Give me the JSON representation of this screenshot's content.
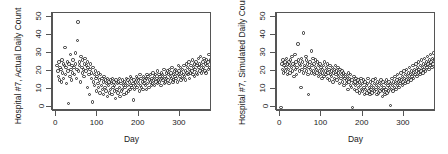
{
  "figure": {
    "background": "#ffffff",
    "axis_color": "#555555",
    "point_color": "#2b2b2b",
    "panel_count": 2
  },
  "chart_data": [
    {
      "type": "scatter",
      "title": "",
      "xlabel": "Day",
      "ylabel": "Hospital #7, Actual Daily Count",
      "xlim": [
        -8,
        378
      ],
      "ylim": [
        -2,
        52
      ],
      "xticks": [
        0,
        100,
        200,
        300
      ],
      "yticks": [
        0,
        10,
        20,
        30,
        40,
        50
      ],
      "grid": false,
      "legend": "none",
      "marker": "open-circle",
      "x": [
        2,
        4,
        5,
        7,
        8,
        9,
        11,
        12,
        14,
        15,
        17,
        18,
        20,
        21,
        22,
        24,
        25,
        27,
        28,
        30,
        31,
        33,
        34,
        36,
        37,
        38,
        40,
        41,
        43,
        44,
        46,
        47,
        49,
        50,
        51,
        53,
        54,
        56,
        57,
        59,
        60,
        62,
        63,
        64,
        66,
        67,
        69,
        70,
        72,
        73,
        75,
        76,
        77,
        79,
        80,
        82,
        83,
        85,
        86,
        88,
        89,
        90,
        92,
        93,
        95,
        96,
        98,
        99,
        101,
        102,
        103,
        105,
        106,
        108,
        109,
        111,
        112,
        114,
        115,
        116,
        118,
        119,
        121,
        122,
        124,
        125,
        127,
        128,
        129,
        131,
        132,
        134,
        135,
        137,
        138,
        140,
        141,
        142,
        144,
        145,
        147,
        148,
        150,
        151,
        153,
        154,
        155,
        157,
        158,
        160,
        161,
        163,
        164,
        166,
        167,
        168,
        170,
        171,
        173,
        174,
        176,
        177,
        179,
        180,
        181,
        183,
        184,
        186,
        187,
        189,
        190,
        192,
        193,
        194,
        196,
        197,
        199,
        200,
        202,
        203,
        205,
        206,
        207,
        209,
        210,
        212,
        213,
        215,
        216,
        218,
        219,
        220,
        222,
        223,
        225,
        226,
        228,
        229,
        231,
        232,
        233,
        235,
        236,
        238,
        239,
        241,
        242,
        244,
        245,
        246,
        248,
        249,
        251,
        252,
        254,
        255,
        257,
        258,
        259,
        261,
        262,
        264,
        265,
        267,
        268,
        270,
        271,
        272,
        274,
        275,
        277,
        278,
        280,
        281,
        283,
        284,
        285,
        287,
        288,
        290,
        291,
        293,
        294,
        296,
        297,
        298,
        300,
        301,
        303,
        304,
        306,
        307,
        309,
        310,
        311,
        313,
        314,
        316,
        317,
        319,
        320,
        322,
        323,
        324,
        326,
        327,
        329,
        330,
        332,
        333,
        335,
        336,
        337,
        339,
        340,
        342,
        343,
        345,
        346,
        348,
        349,
        350,
        352,
        353,
        355,
        356,
        358,
        359,
        361,
        362,
        363,
        365,
        366,
        368,
        369,
        371,
        372,
        374
      ],
      "y": [
        23,
        20,
        17,
        25,
        15,
        22,
        21,
        14,
        26,
        19,
        24,
        16,
        23,
        33,
        18,
        22,
        13,
        25,
        20,
        2,
        24,
        17,
        29,
        21,
        15,
        23,
        19,
        26,
        22,
        18,
        30,
        24,
        16,
        21,
        37,
        47,
        20,
        25,
        23,
        14,
        28,
        22,
        19,
        26,
        21,
        17,
        24,
        27,
        20,
        23,
        11,
        25,
        22,
        18,
        7,
        21,
        24,
        16,
        19,
        3,
        22,
        14,
        18,
        12,
        20,
        16,
        9,
        17,
        13,
        19,
        11,
        15,
        8,
        18,
        12,
        16,
        10,
        14,
        7,
        17,
        11,
        15,
        9,
        13,
        6,
        16,
        12,
        14,
        8,
        15,
        10,
        13,
        7,
        16,
        11,
        14,
        9,
        12,
        5,
        15,
        10,
        13,
        8,
        14,
        11,
        16,
        6,
        13,
        9,
        15,
        10,
        12,
        7,
        14,
        11,
        13,
        8,
        16,
        12,
        15,
        9,
        14,
        10,
        17,
        12,
        16,
        11,
        13,
        4,
        15,
        10,
        14,
        12,
        17,
        11,
        16,
        13,
        15,
        9,
        18,
        12,
        16,
        11,
        14,
        10,
        17,
        13,
        15,
        12,
        16,
        10,
        18,
        13,
        17,
        11,
        15,
        14,
        18,
        12,
        16,
        13,
        19,
        15,
        17,
        12,
        18,
        14,
        16,
        13,
        20,
        15,
        18,
        14,
        17,
        12,
        19,
        16,
        18,
        15,
        21,
        13,
        17,
        14,
        19,
        16,
        20,
        15,
        18,
        13,
        21,
        17,
        19,
        16,
        22,
        14,
        18,
        15,
        20,
        17,
        21,
        16,
        19,
        14,
        23,
        18,
        20,
        17,
        22,
        15,
        19,
        16,
        21,
        18,
        23,
        17,
        20,
        15,
        24,
        19,
        22,
        18,
        25,
        16,
        21,
        19,
        23,
        20,
        26,
        18,
        22,
        17,
        24,
        21,
        25,
        19,
        23,
        18,
        27,
        22,
        24,
        20,
        28,
        19,
        23,
        21,
        25,
        22,
        27,
        20,
        24,
        19,
        26,
        23,
        25,
        21,
        29,
        22,
        26,
        24,
        28,
        20,
        23,
        21,
        25,
        22,
        27,
        19,
        24,
        18,
        16
      ]
    },
    {
      "type": "scatter",
      "title": "",
      "xlabel": "Day",
      "ylabel": "Hospital #7, Simulated Daily Count",
      "xlim": [
        -8,
        378
      ],
      "ylim": [
        -2,
        52
      ],
      "xticks": [
        0,
        100,
        200,
        300
      ],
      "yticks": [
        0,
        10,
        20,
        30,
        40,
        50
      ],
      "grid": false,
      "legend": "none",
      "marker": "open-circle",
      "x": [
        2,
        4,
        5,
        7,
        8,
        9,
        11,
        12,
        14,
        15,
        17,
        18,
        20,
        21,
        22,
        24,
        25,
        27,
        28,
        30,
        31,
        33,
        34,
        36,
        37,
        38,
        40,
        41,
        43,
        44,
        46,
        47,
        49,
        50,
        51,
        53,
        54,
        56,
        57,
        59,
        60,
        62,
        63,
        64,
        66,
        67,
        69,
        70,
        72,
        73,
        75,
        76,
        77,
        79,
        80,
        82,
        83,
        85,
        86,
        88,
        89,
        90,
        92,
        93,
        95,
        96,
        98,
        99,
        101,
        102,
        103,
        105,
        106,
        108,
        109,
        111,
        112,
        114,
        115,
        116,
        118,
        119,
        121,
        122,
        124,
        125,
        127,
        128,
        129,
        131,
        132,
        134,
        135,
        137,
        138,
        140,
        141,
        142,
        144,
        145,
        147,
        148,
        150,
        151,
        153,
        154,
        155,
        157,
        158,
        160,
        161,
        163,
        164,
        166,
        167,
        168,
        170,
        171,
        173,
        174,
        176,
        177,
        179,
        180,
        181,
        183,
        184,
        186,
        187,
        189,
        190,
        192,
        193,
        194,
        196,
        197,
        199,
        200,
        202,
        203,
        205,
        206,
        207,
        209,
        210,
        212,
        213,
        215,
        216,
        218,
        219,
        220,
        222,
        223,
        225,
        226,
        228,
        229,
        231,
        232,
        233,
        235,
        236,
        238,
        239,
        241,
        242,
        244,
        245,
        246,
        248,
        249,
        251,
        252,
        254,
        255,
        257,
        258,
        259,
        261,
        262,
        264,
        265,
        267,
        268,
        270,
        271,
        272,
        274,
        275,
        277,
        278,
        280,
        281,
        283,
        284,
        285,
        287,
        288,
        290,
        291,
        293,
        294,
        296,
        297,
        298,
        300,
        301,
        303,
        304,
        306,
        307,
        309,
        310,
        311,
        313,
        314,
        316,
        317,
        319,
        320,
        322,
        323,
        324,
        326,
        327,
        329,
        330,
        332,
        333,
        335,
        336,
        337,
        339,
        340,
        342,
        343,
        345,
        346,
        348,
        349,
        350,
        352,
        353,
        355,
        356,
        358,
        359,
        361,
        362,
        363,
        365,
        366,
        368,
        369,
        371,
        372,
        374
      ],
      "y": [
        0,
        24,
        21,
        26,
        19,
        23,
        25,
        20,
        22,
        27,
        18,
        24,
        21,
        25,
        23,
        19,
        26,
        22,
        28,
        20,
        24,
        17,
        23,
        29,
        21,
        25,
        18,
        22,
        35,
        26,
        20,
        24,
        23,
        11,
        27,
        21,
        25,
        19,
        41,
        23,
        22,
        28,
        20,
        26,
        24,
        18,
        7,
        22,
        25,
        21,
        31,
        19,
        23,
        27,
        20,
        24,
        18,
        22,
        26,
        21,
        19,
        25,
        17,
        23,
        20,
        24,
        18,
        22,
        16,
        21,
        19,
        23,
        17,
        25,
        20,
        18,
        22,
        16,
        24,
        19,
        21,
        15,
        23,
        18,
        20,
        17,
        22,
        14,
        19,
        21,
        16,
        23,
        18,
        20,
        15,
        22,
        17,
        19,
        13,
        21,
        16,
        18,
        20,
        14,
        17,
        19,
        12,
        16,
        18,
        15,
        13,
        17,
        10,
        19,
        14,
        16,
        12,
        18,
        11,
        15,
        0,
        13,
        17,
        10,
        14,
        12,
        16,
        9,
        13,
        15,
        11,
        14,
        8,
        12,
        16,
        10,
        13,
        9,
        15,
        11,
        7,
        14,
        10,
        12,
        8,
        13,
        16,
        9,
        11,
        7,
        14,
        10,
        12,
        8,
        15,
        11,
        13,
        9,
        16,
        10,
        12,
        7,
        14,
        11,
        8,
        13,
        9,
        15,
        10,
        12,
        6,
        14,
        9,
        11,
        7,
        13,
        10,
        15,
        8,
        12,
        9,
        14,
        11,
        1,
        13,
        10,
        16,
        12,
        9,
        14,
        11,
        17,
        13,
        10,
        15,
        12,
        18,
        14,
        11,
        16,
        13,
        19,
        15,
        12,
        17,
        14,
        20,
        16,
        13,
        18,
        15,
        21,
        17,
        14,
        19,
        16,
        22,
        18,
        15,
        20,
        17,
        23,
        19,
        16,
        21,
        18,
        24,
        20,
        17,
        22,
        19,
        25,
        21,
        18,
        23,
        20,
        26,
        22,
        19,
        24,
        21,
        27,
        23,
        20,
        25,
        22,
        28,
        24,
        21,
        26,
        23,
        29,
        25,
        22,
        27,
        24,
        30,
        26,
        23,
        28,
        19,
        21
      ]
    }
  ],
  "panels": [
    {
      "name": "actual",
      "ylabel": "Hospital #7, Actual Daily Count",
      "xlabel": "Day",
      "yticks": [
        "0",
        "10",
        "20",
        "30",
        "40",
        "50"
      ],
      "xticks": [
        "0",
        "100",
        "200",
        "300"
      ]
    },
    {
      "name": "simulated",
      "ylabel": "Hospital #7, Simulated Daily Count",
      "xlabel": "Day",
      "yticks": [
        "0",
        "10",
        "20",
        "30",
        "40",
        "50"
      ],
      "xticks": [
        "0",
        "100",
        "200",
        "300"
      ]
    }
  ]
}
